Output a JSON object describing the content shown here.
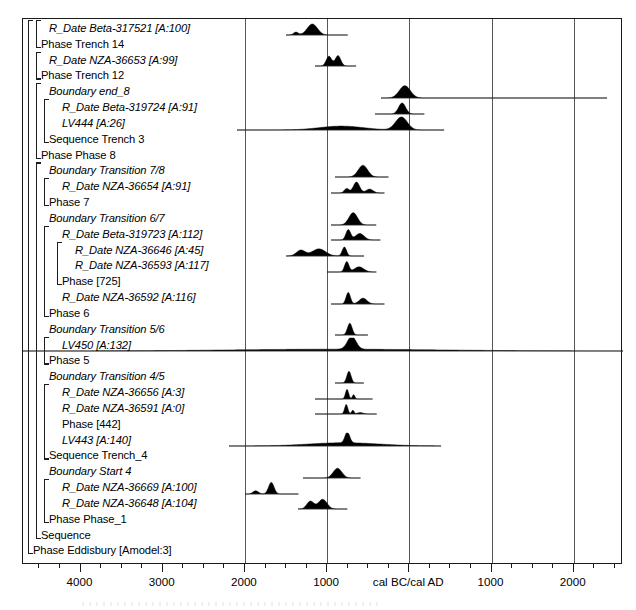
{
  "chart_data": {
    "type": "area",
    "xlabel": "cal BC/cal AD",
    "ylabel": "",
    "grid": true,
    "legend_position": "none",
    "xlim": [
      -4700,
      2600
    ],
    "x_axis": {
      "center_label": "cal BC/cal AD",
      "major_ticks": [
        {
          "value": -4000,
          "label": "4000"
        },
        {
          "value": -3000,
          "label": "3000"
        },
        {
          "value": -2000,
          "label": "2000"
        },
        {
          "value": -1000,
          "label": "1000"
        },
        {
          "value": 0,
          "label": "cal BC/cal AD"
        },
        {
          "value": 1000,
          "label": "1000"
        },
        {
          "value": 2000,
          "label": "2000"
        }
      ],
      "minor_tick_interval": 250,
      "gridline_values": [
        -2000,
        -1000,
        0,
        1000,
        2000
      ]
    },
    "rows": [
      {
        "label": "R_Date Beta-317521 [A:100]",
        "style": "italic",
        "indent": 2,
        "type": "date",
        "range": [
          -1500,
          -750
        ],
        "peaks": [
          {
            "x": -1380,
            "h": 0.22,
            "w": 60
          },
          {
            "x": -1180,
            "h": 0.85,
            "w": 130
          }
        ]
      },
      {
        "label": "Phase Trench 14",
        "style": "normal",
        "indent": 1,
        "type": "group"
      },
      {
        "label": "R_Date NZA-36653 [A:99]",
        "style": "italic",
        "indent": 2,
        "type": "date",
        "range": [
          -1150,
          -650
        ],
        "peaks": [
          {
            "x": -980,
            "h": 0.75,
            "w": 70
          },
          {
            "x": -870,
            "h": 0.8,
            "w": 70
          }
        ]
      },
      {
        "label": "Phase Trench 12",
        "style": "normal",
        "indent": 1,
        "type": "group"
      },
      {
        "label": "Boundary end_8",
        "style": "italic",
        "indent": 2,
        "type": "boundary",
        "range": [
          -350,
          2400
        ],
        "peaks": [
          {
            "x": -60,
            "h": 0.95,
            "w": 140
          }
        ]
      },
      {
        "label": "R_Date Beta-319724 [A:91]",
        "style": "italic",
        "indent": 3,
        "type": "date",
        "range": [
          -420,
          180
        ],
        "peaks": [
          {
            "x": -90,
            "h": 0.85,
            "w": 90
          }
        ]
      },
      {
        "label": "LV444 [A:26]",
        "style": "italic",
        "indent": 3,
        "type": "date",
        "range": [
          -2100,
          420
        ],
        "peaks": [
          {
            "x": -830,
            "h": 0.3,
            "w": 560
          },
          {
            "x": -100,
            "h": 1.0,
            "w": 150
          }
        ]
      },
      {
        "label": "Sequence Trench 3",
        "style": "normal",
        "indent": 2,
        "type": "group"
      },
      {
        "label": "Phase Phase 8",
        "style": "normal",
        "indent": 1,
        "type": "group"
      },
      {
        "label": "Boundary Transition 7/8",
        "style": "italic",
        "indent": 2,
        "type": "boundary",
        "range": [
          -900,
          -250
        ],
        "peaks": [
          {
            "x": -560,
            "h": 0.9,
            "w": 120
          }
        ]
      },
      {
        "label": "R_Date NZA-36654 [A:91]",
        "style": "italic",
        "indent": 3,
        "type": "date",
        "range": [
          -950,
          -300
        ],
        "peaks": [
          {
            "x": -760,
            "h": 0.35,
            "w": 60
          },
          {
            "x": -640,
            "h": 0.85,
            "w": 80
          },
          {
            "x": -480,
            "h": 0.3,
            "w": 90
          }
        ]
      },
      {
        "label": "Phase 7",
        "style": "normal",
        "indent": 2,
        "type": "group"
      },
      {
        "label": "Boundary Transition 6/7",
        "style": "italic",
        "indent": 2,
        "type": "boundary",
        "range": [
          -950,
          -400
        ],
        "peaks": [
          {
            "x": -680,
            "h": 0.95,
            "w": 110
          }
        ]
      },
      {
        "label": "R_Date Beta-319723 [A:112]",
        "style": "italic",
        "indent": 3,
        "type": "date",
        "range": [
          -950,
          -350
        ],
        "peaks": [
          {
            "x": -740,
            "h": 0.8,
            "w": 60
          },
          {
            "x": -600,
            "h": 0.5,
            "w": 110
          }
        ]
      },
      {
        "label": "R_Date NZA-36646 [A:45]",
        "style": "italic",
        "indent": 4,
        "type": "date",
        "range": [
          -1500,
          -550
        ],
        "peaks": [
          {
            "x": -1320,
            "h": 0.45,
            "w": 110
          },
          {
            "x": -1100,
            "h": 0.55,
            "w": 170
          },
          {
            "x": -790,
            "h": 0.7,
            "w": 55
          }
        ]
      },
      {
        "label": "R_Date NZA-36593 [A:117]",
        "style": "italic",
        "indent": 4,
        "type": "date",
        "range": [
          -1000,
          -400
        ],
        "peaks": [
          {
            "x": -760,
            "h": 0.8,
            "w": 55
          },
          {
            "x": -610,
            "h": 0.4,
            "w": 120
          }
        ]
      },
      {
        "label": "Phase [725]",
        "style": "normal",
        "indent": 3,
        "type": "group"
      },
      {
        "label": "R_Date NZA-36592 [A:116]",
        "style": "italic",
        "indent": 3,
        "type": "date",
        "range": [
          -950,
          -300
        ],
        "peaks": [
          {
            "x": -740,
            "h": 0.9,
            "w": 55
          },
          {
            "x": -560,
            "h": 0.45,
            "w": 100
          }
        ]
      },
      {
        "label": "Phase 6",
        "style": "normal",
        "indent": 2,
        "type": "group"
      },
      {
        "label": "Boundary Transition 5/6",
        "style": "italic",
        "indent": 2,
        "type": "boundary",
        "range": [
          -900,
          -500
        ],
        "peaks": [
          {
            "x": -720,
            "h": 0.9,
            "w": 60
          }
        ]
      },
      {
        "label": "LV450 [A:132]",
        "style": "italic",
        "indent": 3,
        "type": "date",
        "range": [
          -4700,
          2600
        ],
        "peaks": [
          {
            "x": -700,
            "h": 1.0,
            "w": 110
          },
          {
            "x": -900,
            "h": 0.14,
            "w": 2600
          }
        ]
      },
      {
        "label": "Phase 5",
        "style": "normal",
        "indent": 2,
        "type": "group"
      },
      {
        "label": "Boundary Transition 4/5",
        "style": "italic",
        "indent": 2,
        "type": "boundary",
        "range": [
          -900,
          -550
        ],
        "peaks": [
          {
            "x": -730,
            "h": 0.9,
            "w": 55
          }
        ]
      },
      {
        "label": "R_Date NZA-36656 [A:3]",
        "style": "italic",
        "indent": 3,
        "type": "date",
        "range": [
          -1150,
          -450
        ],
        "peaks": [
          {
            "x": -760,
            "h": 0.75,
            "w": 40
          },
          {
            "x": -680,
            "h": 0.35,
            "w": 30
          }
        ]
      },
      {
        "label": "R_Date NZA-36591 [A:0]",
        "style": "italic",
        "indent": 3,
        "type": "date",
        "range": [
          -1150,
          -400
        ],
        "peaks": [
          {
            "x": -770,
            "h": 0.75,
            "w": 40
          },
          {
            "x": -690,
            "h": 0.3,
            "w": 30
          },
          {
            "x": -600,
            "h": 0.12,
            "w": 70
          }
        ]
      },
      {
        "label": "Phase [442]",
        "style": "normal",
        "indent": 3,
        "type": "group"
      },
      {
        "label": "LV443 [A:140]",
        "style": "italic",
        "indent": 3,
        "type": "date",
        "range": [
          -2200,
          380
        ],
        "peaks": [
          {
            "x": -760,
            "h": 0.85,
            "w": 60
          },
          {
            "x": -800,
            "h": 0.25,
            "w": 900
          }
        ]
      },
      {
        "label": "Sequence Trench_4",
        "style": "normal",
        "indent": 2,
        "type": "group"
      },
      {
        "label": "Boundary Start 4",
        "style": "italic",
        "indent": 2,
        "type": "boundary",
        "range": [
          -1300,
          -600
        ],
        "peaks": [
          {
            "x": -880,
            "h": 0.75,
            "w": 110
          }
        ]
      },
      {
        "label": "R_Date NZA-36669 [A:100]",
        "style": "italic",
        "indent": 3,
        "type": "date",
        "range": [
          -2000,
          -1350
        ],
        "peaks": [
          {
            "x": -1870,
            "h": 0.25,
            "w": 70
          },
          {
            "x": -1680,
            "h": 0.9,
            "w": 70
          }
        ]
      },
      {
        "label": "R_Date NZA-36648 [A:104]",
        "style": "italic",
        "indent": 3,
        "type": "date",
        "range": [
          -1350,
          -750
        ],
        "peaks": [
          {
            "x": -1200,
            "h": 0.6,
            "w": 90
          },
          {
            "x": -1050,
            "h": 0.75,
            "w": 110
          }
        ]
      },
      {
        "label": "Phase Phase_1",
        "style": "normal",
        "indent": 2,
        "type": "group"
      },
      {
        "label": "Sequence",
        "style": "normal",
        "indent": 1,
        "type": "group"
      },
      {
        "label": "Phase Eddisbury [Amodel:3]",
        "style": "normal",
        "indent": 0,
        "type": "group"
      }
    ]
  },
  "colors": {
    "frame": "#1a1a1a",
    "grid": "#55565a",
    "distribution_fill": "#000000",
    "text": "#000000"
  }
}
